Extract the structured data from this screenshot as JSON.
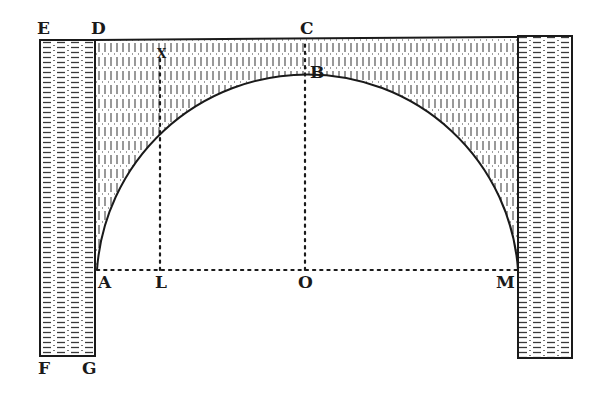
{
  "figure": {
    "type": "arch-geometry-engraving",
    "colors": {
      "ink": "#1a1a1a",
      "paper": "#ffffff",
      "hatch": "#3a3a3a"
    }
  },
  "labels": {
    "E": "E",
    "D": "D",
    "C": "C",
    "B": "B",
    "X": "X",
    "A": "A",
    "L": "L",
    "O": "O",
    "M": "M",
    "F": "F",
    "G": "G"
  },
  "points": {
    "E": [
      40,
      40
    ],
    "D": [
      95,
      40
    ],
    "C": [
      307,
      38
    ],
    "B": [
      305,
      60
    ],
    "X": [
      160,
      55
    ],
    "A": [
      97,
      270
    ],
    "L": [
      160,
      270
    ],
    "O": [
      305,
      270
    ],
    "M": [
      518,
      270
    ],
    "F": [
      40,
      356
    ],
    "G": [
      95,
      356
    ]
  },
  "lines": {
    "springing_line": "AM (dotted)",
    "vertical_axis": "OB (dotted)",
    "ordinate": "LX (dotted)",
    "top_line": "DC extended to right pier",
    "intrados": "semicircular arc A-B-M"
  }
}
